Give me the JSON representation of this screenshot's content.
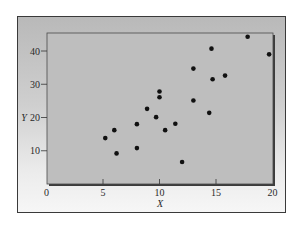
{
  "chart_data": {
    "type": "scatter",
    "title": "",
    "xlabel": "X",
    "ylabel": "Y",
    "xlim": [
      0,
      20
    ],
    "ylim": [
      0,
      45
    ],
    "xticks": [
      0,
      5,
      10,
      15,
      20
    ],
    "yticks": [
      10,
      20,
      30,
      40
    ],
    "grid": false,
    "legend": null,
    "series": [
      {
        "name": "data",
        "color": "#111111",
        "points": [
          {
            "x": 5.2,
            "y": 13.8
          },
          {
            "x": 6.0,
            "y": 16.2
          },
          {
            "x": 6.2,
            "y": 9.2
          },
          {
            "x": 8.0,
            "y": 18.0
          },
          {
            "x": 8.0,
            "y": 10.8
          },
          {
            "x": 8.9,
            "y": 22.6
          },
          {
            "x": 9.7,
            "y": 20.1
          },
          {
            "x": 10.0,
            "y": 27.8
          },
          {
            "x": 10.0,
            "y": 26.1
          },
          {
            "x": 10.5,
            "y": 16.2
          },
          {
            "x": 11.4,
            "y": 18.1
          },
          {
            "x": 12.0,
            "y": 6.6
          },
          {
            "x": 13.0,
            "y": 34.7
          },
          {
            "x": 13.0,
            "y": 25.1
          },
          {
            "x": 14.4,
            "y": 21.4
          },
          {
            "x": 14.6,
            "y": 40.7
          },
          {
            "x": 14.7,
            "y": 31.5
          },
          {
            "x": 15.8,
            "y": 32.6
          },
          {
            "x": 17.8,
            "y": 44.3
          },
          {
            "x": 19.7,
            "y": 39.0
          }
        ]
      }
    ]
  },
  "colors": {
    "plot_bg": "#bebebe",
    "plot_shadow": "#3c3c3c",
    "marker": "#111111"
  }
}
